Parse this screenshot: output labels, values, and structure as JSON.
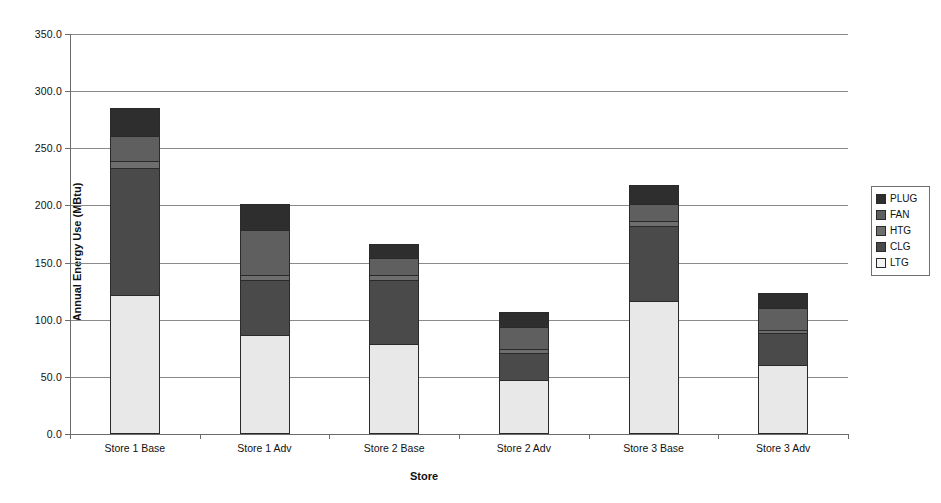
{
  "chart_data": {
    "type": "bar",
    "stacked": true,
    "title": "",
    "xlabel": "Store",
    "ylabel": "Annual Energy Use (MBtu)",
    "ylim": [
      0.0,
      350.0
    ],
    "ytick_labels": [
      "0.0",
      "50.0",
      "100.0",
      "150.0",
      "200.0",
      "250.0",
      "300.0",
      "350.0"
    ],
    "ytick_values": [
      0.0,
      50.0,
      100.0,
      150.0,
      200.0,
      250.0,
      300.0,
      350.0
    ],
    "grid": "horizontal",
    "legend_position": "right",
    "categories": [
      "Store 1 Base",
      "Store 1 Adv",
      "Store 2 Base",
      "Store 2 Adv",
      "Store 3 Base",
      "Store 3 Adv"
    ],
    "stack_order_bottom_to_top": [
      "LTG",
      "CLG",
      "HTG",
      "FAN",
      "PLUG"
    ],
    "series": [
      {
        "name": "LTG",
        "color": "#e8e8e8",
        "values": [
          122.0,
          87.0,
          79.0,
          47.0,
          116.0,
          60.0
        ]
      },
      {
        "name": "CLG",
        "color": "#4a4a4a",
        "values": [
          112.0,
          49.0,
          57.0,
          25.0,
          67.0,
          29.0
        ]
      },
      {
        "name": "HTG",
        "color": "#6e6e6e",
        "values": [
          7.0,
          5.0,
          5.0,
          4.0,
          5.0,
          4.0
        ]
      },
      {
        "name": "FAN",
        "color": "#5f5f5f",
        "values": [
          22.0,
          40.0,
          16.0,
          20.0,
          16.0,
          20.0
        ]
      },
      {
        "name": "PLUG",
        "color": "#2e2e2e",
        "values": [
          26.0,
          24.0,
          13.0,
          14.0,
          17.0,
          14.0
        ]
      }
    ],
    "totals": [
      289.0,
      205.0,
      170.0,
      110.0,
      221.0,
      127.0
    ]
  },
  "legend": {
    "items": [
      {
        "label": "PLUG",
        "color": "#2e2e2e"
      },
      {
        "label": "FAN",
        "color": "#5f5f5f"
      },
      {
        "label": "HTG",
        "color": "#6e6e6e"
      },
      {
        "label": "CLG",
        "color": "#4a4a4a"
      },
      {
        "label": "LTG",
        "color": "#f2f2f2"
      }
    ]
  },
  "axes": {
    "y_title": "Annual Energy Use (MBtu)",
    "x_title": "Store"
  }
}
